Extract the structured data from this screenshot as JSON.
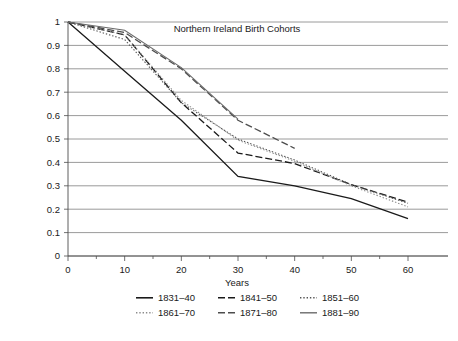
{
  "chart_data": {
    "type": "line",
    "title": "Northern Ireland Birth Cohorts",
    "xlabel": "Years",
    "ylabel": "",
    "xlim": [
      0,
      60
    ],
    "ylim": [
      0,
      1
    ],
    "x_ticks": [
      0,
      10,
      20,
      30,
      40,
      50,
      60
    ],
    "x_tick_labels": [
      "0",
      "10",
      "20",
      "30",
      "40",
      "50",
      "60"
    ],
    "x_minor_tick_step": 5,
    "y_ticks": [
      0,
      0.1,
      0.2,
      0.3,
      0.4,
      0.5,
      0.6,
      0.7,
      0.8,
      0.9,
      1
    ],
    "y_tick_labels": [
      "0",
      "0.1",
      "0.2",
      "0.3",
      "0.4",
      "0.5",
      "0.6",
      "0.7",
      "0.8",
      "0.9",
      "1"
    ],
    "grid": "horizontal",
    "legend_position": "bottom",
    "series": [
      {
        "name": "1831–40",
        "style": "solid",
        "color": "#1a1a1a",
        "width": 1.3,
        "dash": "",
        "x": [
          0,
          10,
          20,
          30,
          40,
          50,
          60
        ],
        "values": [
          1.0,
          0.79,
          0.58,
          0.34,
          0.3,
          0.245,
          0.16
        ]
      },
      {
        "name": "1841–50",
        "style": "dashed",
        "color": "#1a1a1a",
        "width": 1.3,
        "dash": "7,3",
        "x": [
          0,
          10,
          20,
          30,
          40,
          50,
          60
        ],
        "values": [
          1.0,
          0.945,
          0.655,
          0.44,
          0.395,
          0.305,
          0.23
        ]
      },
      {
        "name": "1851–60",
        "style": "dotted",
        "color": "#555555",
        "width": 1.1,
        "dash": "1.4,1.9",
        "x": [
          0,
          10,
          20,
          30,
          40,
          50,
          60
        ],
        "values": [
          1.0,
          0.925,
          0.655,
          0.5,
          0.41,
          0.305,
          0.225
        ]
      },
      {
        "name": "1861–70",
        "style": "dotted",
        "color": "#8c8c8c",
        "width": 1.1,
        "dash": "1.4,1.9",
        "x": [
          0,
          10,
          20,
          30,
          40,
          50,
          60
        ],
        "values": [
          1.0,
          0.945,
          0.665,
          0.495,
          0.405,
          0.3,
          0.21
        ]
      },
      {
        "name": "1871–80",
        "style": "dashed",
        "color": "#4d4d4d",
        "width": 1.3,
        "dash": "7,3",
        "x": [
          0,
          10,
          20,
          30,
          40
        ],
        "values": [
          1.0,
          0.955,
          0.8,
          0.58,
          0.46
        ]
      },
      {
        "name": "1881–90",
        "style": "solid",
        "color": "#6b6b6b",
        "width": 1.1,
        "dash": "",
        "x": [
          0,
          10,
          20,
          30
        ],
        "values": [
          1.0,
          0.965,
          0.805,
          0.585
        ]
      }
    ],
    "legend_rows": [
      [
        "1831–40",
        "1841–50",
        "1851–60"
      ],
      [
        "1861–70",
        "1871–80",
        "1881–90"
      ]
    ]
  },
  "axes": {
    "plot_left": 68,
    "plot_right": 408,
    "plot_top": 22,
    "plot_bottom": 256,
    "x_axis_extra_right": 448,
    "title_x": 237,
    "title_y": 32,
    "xlabel_x": 237,
    "xlabel_y": 286
  },
  "legend": {
    "row_y": [
      301,
      316
    ],
    "col_x": [
      136,
      218,
      300
    ],
    "sample_width": 17,
    "label_offset": 22
  }
}
